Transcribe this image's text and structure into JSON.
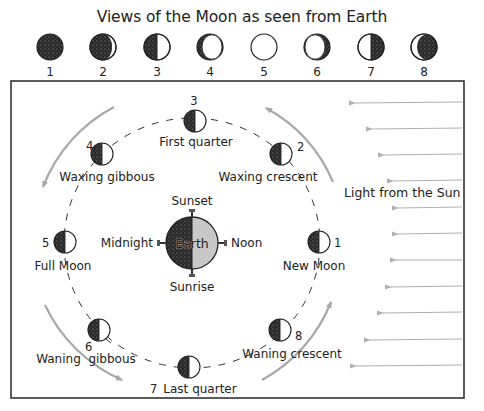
{
  "title": "Views of the Moon as seen from Earth",
  "colors": {
    "dark_side": "#2a2a2a",
    "light_side": "#ffffff",
    "earth_day": "#c8c8c8",
    "orbit_path": "#333333",
    "motion_arrow": "#a8a8a8",
    "sunlight_arrow": "#b0b0b0",
    "frame": "#333333"
  },
  "views_row": [
    {
      "number": "1",
      "view": "new"
    },
    {
      "number": "2",
      "view": "waxing-crescent"
    },
    {
      "number": "3",
      "view": "first-quarter"
    },
    {
      "number": "4",
      "view": "waxing-gibbous"
    },
    {
      "number": "5",
      "view": "full"
    },
    {
      "number": "6",
      "view": "waning-gibbous"
    },
    {
      "number": "7",
      "view": "last-quarter"
    },
    {
      "number": "8",
      "view": "waning-crescent"
    }
  ],
  "orbit": {
    "earth_label": "Earth",
    "time_labels": {
      "top": "Sunset",
      "bottom": "Sunrise",
      "left": "Midnight",
      "right": "Noon"
    },
    "positions": [
      {
        "number": "1",
        "name": "New Moon"
      },
      {
        "number": "2",
        "name": "Waxing crescent"
      },
      {
        "number": "3",
        "name": "First quarter"
      },
      {
        "number": "4",
        "name": "Waxing gibbous"
      },
      {
        "number": "5",
        "name": "Full Moon"
      },
      {
        "number": "6",
        "name": "Waning  gibbous"
      },
      {
        "number": "7",
        "name": "Last quarter"
      },
      {
        "number": "8",
        "name": "Waning crescent"
      }
    ]
  },
  "sunlight_label": "Light from the Sun"
}
